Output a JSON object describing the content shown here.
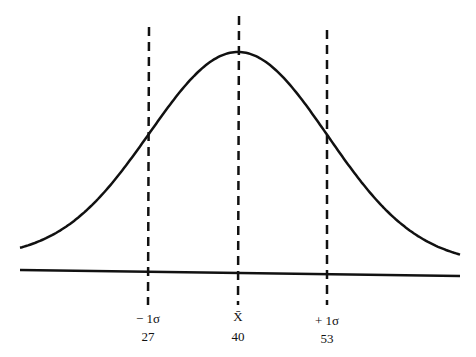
{
  "diagram": {
    "type": "normal-distribution-curve",
    "colors": {
      "line": "#111111",
      "background": "#ffffff"
    },
    "markers": [
      {
        "id": "minus-1-sigma",
        "symbol": "− 1σ",
        "value": "27",
        "x": 148
      },
      {
        "id": "mean",
        "symbol": "X̄",
        "value": "40",
        "x": 238
      },
      {
        "id": "plus-1-sigma",
        "symbol": "+ 1σ",
        "value": "53",
        "x": 327
      }
    ]
  },
  "chart_data": {
    "type": "line",
    "title": "",
    "xlabel": "",
    "ylabel": "",
    "distribution": "normal",
    "mean": 40,
    "std_dev": 13,
    "tick_labels": [
      {
        "label": "− 1σ",
        "value": 27
      },
      {
        "label": "X̄",
        "value": 40
      },
      {
        "label": "+ 1σ",
        "value": 53
      }
    ],
    "reference_lines": [
      {
        "x": 27,
        "style": "dashed"
      },
      {
        "x": 40,
        "style": "dashed"
      },
      {
        "x": 53,
        "style": "dashed"
      }
    ],
    "grid": false,
    "legend": false
  }
}
